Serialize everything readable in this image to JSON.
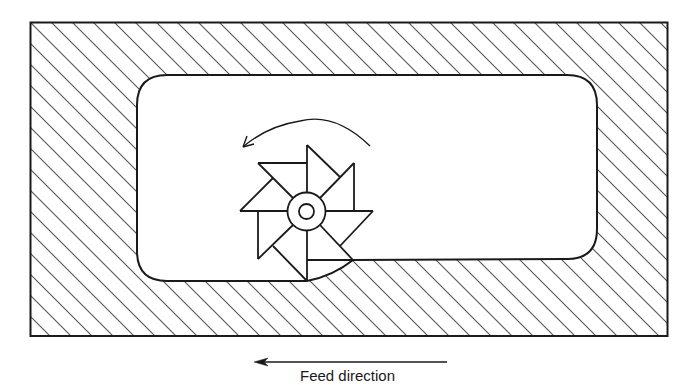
{
  "figure": {
    "type": "end-milling-pocket-diagram",
    "labels": {
      "feed_direction": "Feed direction"
    },
    "elements": {
      "workpiece": "hatched-rectangular-block",
      "pocket": "rounded-rectangle-cavity",
      "cutter": "eight-tooth-pinwheel-milling-cutter",
      "rotation_arrow": "counter-clockwise-arc-arrow",
      "feed_arrow": "leftward-arrow"
    },
    "colors": {
      "stroke": "#1a1a1a",
      "hatch": "#555555",
      "background": "#ffffff"
    }
  }
}
